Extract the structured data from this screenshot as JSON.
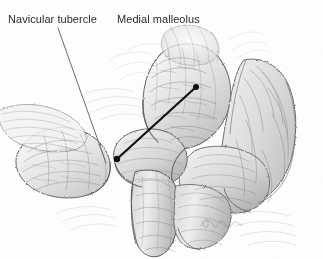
{
  "figure": {
    "type": "anatomical-illustration",
    "medium": "graphite pencil drawing",
    "width": 323,
    "height": 259,
    "background_color": "#ffffff"
  },
  "labels": [
    {
      "id": "navicular-tubercle",
      "text": "Navicular tubercle",
      "x": 8,
      "y": 13,
      "color": "#2b2b2b",
      "font_size": 11
    },
    {
      "id": "medial-malleolus",
      "text": "Medial malleolus",
      "x": 117,
      "y": 13,
      "color": "#2b2b2b",
      "font_size": 11
    }
  ],
  "leader_lines": [
    {
      "id": "navicular-leader",
      "style": "thin",
      "color": "#5a5a5a",
      "width": 0.9,
      "terminal": "none",
      "x1": 58,
      "y1": 28,
      "x2": 106,
      "y2": 163
    },
    {
      "id": "malleolus-leader",
      "style": "thick",
      "color": "#111111",
      "width": 2.2,
      "terminal": "dot",
      "dot_radius": 3,
      "x1": 196,
      "y1": 87,
      "x2": 117,
      "y2": 159
    }
  ],
  "signature": {
    "present": true,
    "text": "",
    "description": "faint cursive artist signature",
    "x": 200,
    "y": 218,
    "color": "#8c8c8c"
  },
  "structures": [
    {
      "name": "navicular-bone",
      "region": "left-lower"
    },
    {
      "name": "medial-malleolus-tibia",
      "region": "upper-center"
    },
    {
      "name": "talus",
      "region": "center"
    },
    {
      "name": "calcaneus-heel",
      "region": "right"
    },
    {
      "name": "tibialis-posterior-tendon",
      "region": "lower-center"
    }
  ]
}
